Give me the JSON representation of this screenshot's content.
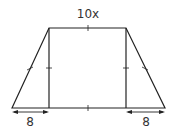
{
  "diagram": {
    "type": "trapezoid-with-rectangle",
    "top_label": "10x",
    "bottom_left_label": "8",
    "bottom_right_label": "8",
    "stroke_color": "#222222"
  }
}
